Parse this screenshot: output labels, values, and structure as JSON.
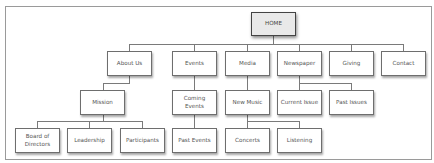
{
  "diagram": {
    "type": "sitemap",
    "root": {
      "id": "home",
      "label": "HOME",
      "box": [
        251,
        12,
        45,
        24
      ]
    },
    "level1": [
      {
        "id": "about-us",
        "label": "About Us",
        "box": [
          107,
          51,
          45,
          25
        ]
      },
      {
        "id": "events",
        "label": "Events",
        "box": [
          172,
          51,
          45,
          25
        ]
      },
      {
        "id": "media",
        "label": "Media",
        "box": [
          225,
          51,
          45,
          25
        ]
      },
      {
        "id": "newspaper",
        "label": "Newspaper",
        "box": [
          277,
          51,
          45,
          25
        ]
      },
      {
        "id": "giving",
        "label": "Giving",
        "box": [
          329,
          51,
          45,
          25
        ]
      },
      {
        "id": "contact",
        "label": "Contact",
        "box": [
          381,
          51,
          45,
          25
        ]
      }
    ],
    "level2": [
      {
        "id": "mission",
        "label": "Mission",
        "parent": "about-us",
        "box": [
          80,
          90,
          45,
          25
        ]
      },
      {
        "id": "coming-events",
        "label": "Coming Events",
        "parent": "events",
        "box": [
          172,
          90,
          45,
          25
        ]
      },
      {
        "id": "new-music",
        "label": "New Music",
        "parent": "media",
        "box": [
          225,
          90,
          45,
          25
        ]
      },
      {
        "id": "current-issue",
        "label": "Current Issue",
        "parent": "newspaper",
        "box": [
          277,
          90,
          45,
          25
        ]
      },
      {
        "id": "past-issues",
        "label": "Past Issues",
        "parent": "newspaper",
        "box": [
          329,
          90,
          45,
          25
        ]
      }
    ],
    "level3": [
      {
        "id": "board-of-directors",
        "label": "Board of Directors",
        "parent": "mission",
        "box": [
          15,
          128,
          45,
          25
        ]
      },
      {
        "id": "leadership",
        "label": "Leadership",
        "parent": "mission",
        "box": [
          67,
          128,
          45,
          25
        ]
      },
      {
        "id": "participants",
        "label": "Participants",
        "parent": "mission",
        "box": [
          120,
          128,
          45,
          25
        ]
      },
      {
        "id": "past-events",
        "label": "Past Events",
        "parent": "coming-events",
        "box": [
          172,
          128,
          45,
          25
        ]
      },
      {
        "id": "concerts",
        "label": "Concerts",
        "parent": "new-music",
        "box": [
          225,
          128,
          45,
          25
        ]
      },
      {
        "id": "listening",
        "label": "Listening",
        "parent": "new-music",
        "box": [
          277,
          128,
          45,
          25
        ]
      }
    ]
  },
  "colors": {
    "root_fill": "#e9e9e9",
    "node_fill": "#ffffff",
    "border": "#6e6e6e",
    "connector": "#7a7a7a",
    "text": "#555555"
  }
}
